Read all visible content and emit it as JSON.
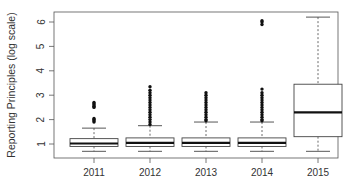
{
  "chart_data": {
    "type": "boxplot",
    "title": "",
    "xlabel": "",
    "ylabel": "Reporting Principles (log scale)",
    "ylim": [
      0.5,
      6.4
    ],
    "yticks": [
      1,
      2,
      3,
      4,
      5,
      6
    ],
    "categories": [
      "2011",
      "2012",
      "2013",
      "2014",
      "2015"
    ],
    "grid": false,
    "legend": null,
    "boxes": [
      {
        "label": "2011",
        "whisker_low": 0.7,
        "q1": 0.9,
        "median": 1.02,
        "q3": 1.22,
        "whisker_high": 1.65,
        "outliers": [
          1.9,
          1.95,
          2.0,
          2.05,
          2.5,
          2.55,
          2.6,
          2.65,
          2.7
        ]
      },
      {
        "label": "2012",
        "whisker_low": 0.7,
        "q1": 0.9,
        "median": 1.05,
        "q3": 1.25,
        "whisker_high": 1.75,
        "outliers": [
          1.8,
          1.9,
          2.0,
          2.1,
          2.2,
          2.3,
          2.4,
          2.5,
          2.6,
          2.7,
          2.8,
          2.9,
          3.0,
          3.1,
          3.2,
          3.35
        ]
      },
      {
        "label": "2013",
        "whisker_low": 0.7,
        "q1": 0.9,
        "median": 1.05,
        "q3": 1.25,
        "whisker_high": 1.9,
        "outliers": [
          1.95,
          2.0,
          2.1,
          2.2,
          2.3,
          2.4,
          2.5,
          2.6,
          2.7,
          2.8,
          2.9,
          3.0,
          3.1
        ]
      },
      {
        "label": "2014",
        "whisker_low": 0.7,
        "q1": 0.9,
        "median": 1.05,
        "q3": 1.25,
        "whisker_high": 1.9,
        "outliers": [
          1.95,
          2.0,
          2.1,
          2.2,
          2.3,
          2.4,
          2.5,
          2.6,
          2.7,
          2.8,
          2.9,
          3.0,
          3.1,
          3.25,
          5.9,
          6.0,
          6.05
        ]
      },
      {
        "label": "2015",
        "whisker_low": 0.7,
        "q1": 1.3,
        "median": 2.3,
        "q3": 3.45,
        "whisker_high": 6.2,
        "outliers": []
      }
    ]
  },
  "colors": {
    "axis": "#555555",
    "box": "#444444",
    "median": "#111111",
    "outlier": "#111111",
    "background": "#ffffff"
  }
}
